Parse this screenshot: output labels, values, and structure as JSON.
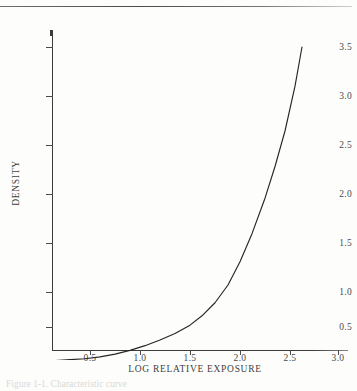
{
  "figure": {
    "caption_fragment": "Figure 1-1.  Characteristic curve",
    "top_rule": "horizontal-rule"
  },
  "chart_data": {
    "type": "line",
    "title": "",
    "xlabel": "LOG RELATIVE EXPOSURE",
    "ylabel": "DENSITY",
    "xlim": [
      0.0,
      3.15
    ],
    "ylim": [
      0.0,
      3.8
    ],
    "xticks": [
      0.5,
      1.0,
      1.5,
      2.0,
      2.5,
      3.0
    ],
    "xtick_labels": [
      "0.5",
      "1.0",
      "1.5",
      "2.0",
      "2.5",
      "3.0"
    ],
    "yticks": [
      0.5,
      1.0,
      1.5,
      2.0,
      2.5,
      3.0,
      3.5
    ],
    "ytick_labels": [
      "0.5",
      "1.0",
      "1.5",
      "2.0",
      "2.5",
      "3.0",
      "3.5"
    ],
    "grid": false,
    "legend": "none",
    "line_color": "#262626",
    "series": [
      {
        "name": "characteristic curve",
        "x": [
          0.02,
          0.15,
          0.3,
          0.45,
          0.6,
          0.75,
          0.9,
          1.05,
          1.2,
          1.35,
          1.5,
          1.62,
          1.75,
          1.88,
          2.0,
          2.12,
          2.25,
          2.35,
          2.45,
          2.55,
          2.62
        ],
        "y": [
          0.14,
          0.14,
          0.15,
          0.16,
          0.18,
          0.21,
          0.25,
          0.3,
          0.36,
          0.43,
          0.52,
          0.62,
          0.76,
          0.95,
          1.2,
          1.5,
          1.88,
          2.22,
          2.6,
          3.08,
          3.5
        ]
      }
    ]
  }
}
